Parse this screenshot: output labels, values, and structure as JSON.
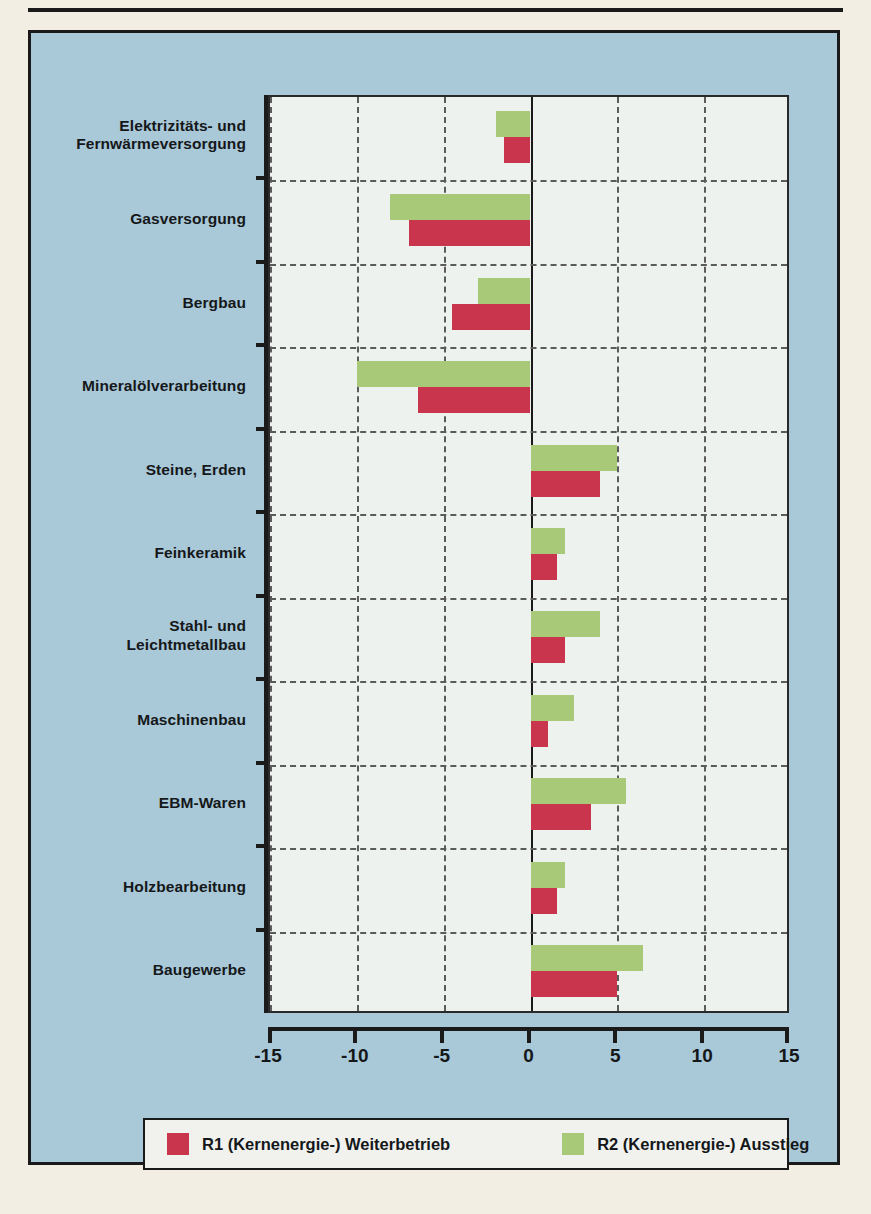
{
  "chart_data": {
    "type": "bar",
    "orientation": "horizontal",
    "title": "",
    "xlabel": "",
    "ylabel": "",
    "xlim": [
      -15,
      15
    ],
    "xticks": [
      -15,
      -10,
      -5,
      0,
      5,
      10,
      15
    ],
    "xtick_labels": [
      "-15",
      "-10",
      "-5",
      "0",
      "5",
      "10",
      "15"
    ],
    "grid": true,
    "legend_position": "bottom",
    "categories": [
      "Elektrizitäts- und\nFernwärmeversorgung",
      "Gasversorgung",
      "Bergbau",
      "Mineralölverarbeitung",
      "Steine, Erden",
      "Feinkeramik",
      "Stahl- und\nLeichtmetallbau",
      "Maschinenbau",
      "EBM-Waren",
      "Holzbearbeitung",
      "Baugewerbe"
    ],
    "series": [
      {
        "name": "R1 (Kernenergie-) Weiterbetrieb",
        "color": "#c9354c",
        "values": [
          -1.5,
          -7.0,
          -4.5,
          -6.5,
          4.0,
          1.5,
          2.0,
          1.0,
          3.5,
          1.5,
          5.0
        ]
      },
      {
        "name": "R2 (Kernenergie-) Ausstieg",
        "color": "#a7c978",
        "values": [
          -2.0,
          -8.1,
          -3.0,
          -10.0,
          5.0,
          2.0,
          4.0,
          2.5,
          5.5,
          2.0,
          6.5
        ]
      }
    ]
  },
  "categories_display": [
    {
      "line1": "Elektrizitäts- und",
      "line2": "Fernwärmeversorgung"
    },
    {
      "line1": "Gasversorgung",
      "line2": ""
    },
    {
      "line1": "Bergbau",
      "line2": ""
    },
    {
      "line1": "Mineralölverarbeitung",
      "line2": ""
    },
    {
      "line1": "Steine, Erden",
      "line2": ""
    },
    {
      "line1": "Feinkeramik",
      "line2": ""
    },
    {
      "line1": "Stahl- und",
      "line2": "Leichtmetallbau"
    },
    {
      "line1": "Maschinenbau",
      "line2": ""
    },
    {
      "line1": "EBM-Waren",
      "line2": ""
    },
    {
      "line1": "Holzbearbeitung",
      "line2": ""
    },
    {
      "line1": "Baugewerbe",
      "line2": ""
    }
  ],
  "legend": {
    "items": [
      {
        "label": "R1 (Kernenergie-) Weiterbetrieb",
        "color": "#c9354c"
      },
      {
        "label": "R2 (Kernenergie-) Ausstieg",
        "color": "#a7c978"
      }
    ]
  },
  "colors": {
    "panel_background": "#a9c8d8",
    "page_background": "#f3eee4",
    "plot_background": "#eef2ef",
    "ink": "#1a1a1a",
    "series_r1": "#c9354c",
    "series_r2": "#a7c978"
  }
}
